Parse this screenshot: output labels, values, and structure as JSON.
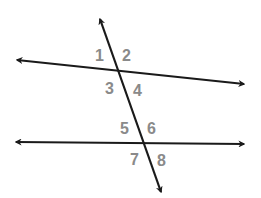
{
  "diagram": {
    "colors": {
      "line": "#1a1a1a",
      "label": "#8a8a8a",
      "background": "#ffffff"
    },
    "lines": [
      {
        "id": "top-line",
        "x1": 17,
        "y1": 60,
        "x2": 244,
        "y2": 84,
        "arrows": "both"
      },
      {
        "id": "bottom-line",
        "x1": 16,
        "y1": 142,
        "x2": 244,
        "y2": 144,
        "arrows": "both"
      },
      {
        "id": "transversal",
        "x1": 100,
        "y1": 19,
        "x2": 161,
        "y2": 192,
        "arrows": "both"
      }
    ],
    "labels": [
      {
        "text": "1",
        "x": 95,
        "y": 61
      },
      {
        "text": "2",
        "x": 122,
        "y": 61
      },
      {
        "text": "3",
        "x": 105,
        "y": 94
      },
      {
        "text": "4",
        "x": 133,
        "y": 96
      },
      {
        "text": "5",
        "x": 120,
        "y": 134
      },
      {
        "text": "6",
        "x": 147,
        "y": 134
      },
      {
        "text": "7",
        "x": 130,
        "y": 165
      },
      {
        "text": "8",
        "x": 157,
        "y": 166
      }
    ]
  }
}
